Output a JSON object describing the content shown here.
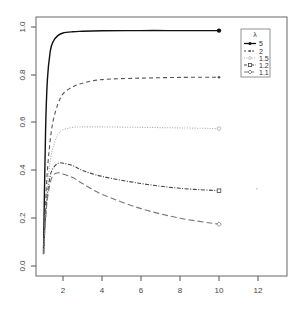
{
  "chart_data": {
    "type": "line",
    "title": "",
    "xlabel": "",
    "ylabel": "",
    "xlim": [
      0.8,
      13.5
    ],
    "ylim": [
      -0.04,
      1.04
    ],
    "x_ticks": [
      "2",
      "4",
      "6",
      "8",
      "10",
      "12"
    ],
    "y_ticks": [
      "0.0",
      "0.2",
      "0.4",
      "0.6",
      "0.8",
      "1.0"
    ],
    "grid": false,
    "legend": {
      "title": "λ",
      "position": "top-right",
      "entries": [
        "5",
        "2",
        "1.5",
        "1.2",
        "1.1"
      ]
    },
    "series": [
      {
        "name": "5",
        "style": "solid",
        "marker": "filled-circle",
        "x": [
          1,
          1.1,
          1.2,
          1.35,
          1.5,
          1.75,
          2,
          2.5,
          3,
          4,
          6,
          8,
          10
        ],
        "values": [
          0.05,
          0.55,
          0.78,
          0.9,
          0.94,
          0.965,
          0.975,
          0.98,
          0.982,
          0.984,
          0.985,
          0.985,
          0.985
        ]
      },
      {
        "name": "2",
        "style": "dashed",
        "marker": "small-dot",
        "x": [
          1,
          1.1,
          1.2,
          1.35,
          1.5,
          1.75,
          2,
          2.5,
          3,
          4,
          6,
          8,
          10
        ],
        "values": [
          0.05,
          0.25,
          0.4,
          0.53,
          0.61,
          0.68,
          0.72,
          0.75,
          0.765,
          0.78,
          0.786,
          0.789,
          0.79
        ]
      },
      {
        "name": "1.5",
        "style": "dotted",
        "marker": "open-circle",
        "x": [
          1,
          1.1,
          1.2,
          1.35,
          1.5,
          1.75,
          2,
          2.5,
          3,
          4,
          6,
          8,
          10
        ],
        "values": [
          0.05,
          0.22,
          0.34,
          0.44,
          0.5,
          0.55,
          0.57,
          0.58,
          0.582,
          0.582,
          0.58,
          0.578,
          0.575
        ]
      },
      {
        "name": "1.2",
        "style": "dot-dash",
        "marker": "open-square",
        "x": [
          1,
          1.1,
          1.2,
          1.35,
          1.5,
          1.75,
          2,
          2.5,
          3,
          4,
          6,
          8,
          10
        ],
        "values": [
          0.05,
          0.2,
          0.3,
          0.38,
          0.41,
          0.43,
          0.43,
          0.42,
          0.4,
          0.375,
          0.345,
          0.325,
          0.315
        ]
      },
      {
        "name": "1.1",
        "style": "long-dash",
        "marker": "open-diamond",
        "x": [
          1,
          1.1,
          1.2,
          1.35,
          1.5,
          1.75,
          2,
          2.5,
          3,
          4,
          6,
          8,
          10
        ],
        "values": [
          0.05,
          0.19,
          0.28,
          0.35,
          0.38,
          0.39,
          0.385,
          0.37,
          0.345,
          0.3,
          0.24,
          0.2,
          0.175
        ]
      }
    ]
  },
  "legend": {
    "title": "λ",
    "labels": [
      "5",
      "2",
      "1.5",
      "1.2",
      "1.1"
    ]
  },
  "axes": {
    "x_ticks": [
      "2",
      "4",
      "6",
      "8",
      "10",
      "12"
    ],
    "y_ticks": [
      "0.0",
      "0.2",
      "0.4",
      "0.6",
      "0.8",
      "1.0"
    ]
  }
}
